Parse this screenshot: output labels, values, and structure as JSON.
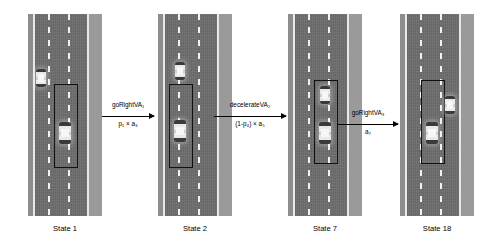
{
  "diagram": {
    "states": [
      {
        "id": "state-1",
        "label": "State 1",
        "x": 28,
        "ego": {
          "lane": "middle",
          "top": 108
        },
        "others": [
          {
            "lane": "left",
            "top": 55
          }
        ],
        "box": {
          "left": 26,
          "top": 70,
          "width": 22,
          "height": 82
        }
      },
      {
        "id": "state-2",
        "label": "State 2",
        "x": 158,
        "ego": {
          "lane": "middle",
          "top": 106
        },
        "others": [
          {
            "lane": "middle",
            "top": 48
          }
        ],
        "box": {
          "left": 11,
          "top": 70,
          "width": 22,
          "height": 82
        }
      },
      {
        "id": "state-7",
        "label": "State 7",
        "x": 288,
        "ego": {
          "lane": "middle",
          "top": 108
        },
        "others": [
          {
            "lane": "middle",
            "top": 72
          }
        ],
        "box": {
          "left": 26,
          "top": 66,
          "width": 22,
          "height": 82
        }
      },
      {
        "id": "state-18",
        "label": "State 18",
        "x": 400,
        "ego": {
          "lane": "middle",
          "top": 108
        },
        "others": [
          {
            "lane": "right",
            "top": 82
          }
        ],
        "box": {
          "left": 21,
          "top": 66,
          "width": 22,
          "height": 82
        }
      }
    ],
    "transitions": [
      {
        "id": "transition-1",
        "from": "State 1",
        "to": "State 2",
        "action": "goRightVA",
        "action_subscript": "1",
        "probability": "p",
        "probability_subscript": "1",
        "times": "×",
        "cost": "a",
        "cost_subscript": "3",
        "numerator": "goRightVA₁",
        "denominator": "p₁ × a₃",
        "x": 102,
        "y": 116,
        "width": 52
      },
      {
        "id": "transition-2",
        "from": "State 2",
        "to": "State 7",
        "action": "decelerateVA",
        "action_subscript": "2",
        "probability": "(1-p₄)",
        "times": "×",
        "cost": "a",
        "cost_subscript": "5",
        "numerator": "decelerateVA₂",
        "denominator": "(1-p₄) × a₅",
        "x": 214,
        "y": 116,
        "width": 72
      },
      {
        "id": "transition-3",
        "from": "State 7",
        "to": "State 18",
        "action": "goRightVA",
        "action_subscript": "3",
        "probability": "",
        "times": "",
        "cost": "a",
        "cost_subscript": "7",
        "numerator": "goRightVA₃",
        "denominator": "a₇",
        "x": 338,
        "y": 124,
        "width": 60
      }
    ]
  },
  "colors": {
    "asphalt": "#6e6e6e",
    "lane_marking": "#f2f2f2",
    "edge_line": "#e8e8e8",
    "shoulder": "#9a9a9a",
    "ego_box": "#111111",
    "arrow": "#000000",
    "background": "#ffffff"
  }
}
